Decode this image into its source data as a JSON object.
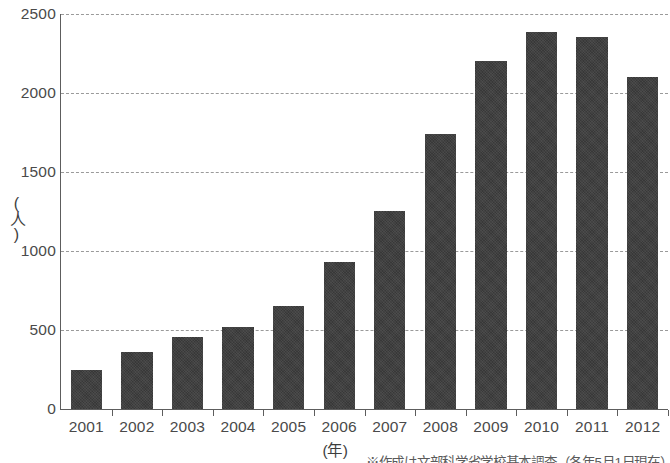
{
  "chart_data": {
    "type": "bar",
    "title": "",
    "subtitle": "",
    "xlabel": "(年)",
    "ylabel": "(人)",
    "categories": [
      "2001",
      "2002",
      "2003",
      "2004",
      "2005",
      "2006",
      "2007",
      "2008",
      "2009",
      "2010",
      "2011",
      "2012"
    ],
    "values": [
      250,
      360,
      455,
      520,
      655,
      930,
      1255,
      1740,
      2205,
      2385,
      2355,
      2100
    ],
    "series": [
      {
        "name": "",
        "values": [
          250,
          360,
          455,
          520,
          655,
          930,
          1255,
          1740,
          2205,
          2385,
          2355,
          2100
        ]
      }
    ],
    "ylim": [
      0,
      2500
    ],
    "y_ticks": [
      0,
      500,
      1000,
      1500,
      2000,
      2500
    ],
    "y_tick_labels": [
      "0",
      "500",
      "1000",
      "1500",
      "2000",
      "2500"
    ],
    "grid": true,
    "grid_style": "dashed-horizontal",
    "legend": false,
    "legend_position": "none",
    "bar_color": "#383838",
    "grid_color": "#9a9a9a",
    "axis_color": "#5d5d5d",
    "text_color": "#4a4a4a"
  },
  "footer": {
    "source_note": "※作成は文部科学省学校基本調査（各年5月1日現在）"
  }
}
